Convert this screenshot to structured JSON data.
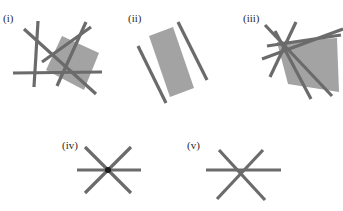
{
  "page": {
    "background_color": "#ffffff",
    "line_color": "#6b6b6b",
    "fill_color": "#a3a3a3",
    "dot_color": "#1a1a1a",
    "label_color": "#2b2b2b",
    "width": 343,
    "height": 211
  },
  "figures": [
    {
      "id": "fig-i",
      "label": "(i)",
      "label_x": 3,
      "label_y": 22,
      "description": "Four lines in general position bounding a shaded quadrilateral",
      "line_count": 4,
      "has_shaded_region": true,
      "shaded_region_sides": 4,
      "polygon": "62,36 99,53 84,90 46,70",
      "lines": [
        {
          "name": "line-1",
          "x1": 24,
          "y1": 29,
          "x2": 96,
          "y2": 94
        },
        {
          "name": "line-2",
          "x1": 38,
          "y1": 21,
          "x2": 34,
          "y2": 87
        },
        {
          "name": "line-3",
          "x1": 86,
          "y1": 22,
          "x2": 57,
          "y2": 86
        },
        {
          "name": "line-4",
          "x1": 13,
          "y1": 73,
          "x2": 102,
          "y2": 72
        },
        {
          "name": "line-5",
          "x1": 42,
          "y1": 62,
          "x2": 91,
          "y2": 27
        }
      ]
    },
    {
      "id": "fig-ii",
      "label": "(ii)",
      "label_x": 128,
      "label_y": 22,
      "description": "Two parallel lines bounding a shaded strip",
      "line_count": 2,
      "has_shaded_region": true,
      "shaded_region_sides": 4,
      "polygon": "149,36 173,27 194,88 170,97",
      "lines": [
        {
          "name": "line-1",
          "x1": 138,
          "y1": 46,
          "x2": 166,
          "y2": 103
        },
        {
          "name": "line-2",
          "x1": 178,
          "y1": 22,
          "x2": 207,
          "y2": 80
        }
      ]
    },
    {
      "id": "fig-iii",
      "label": "(iii)",
      "label_x": 243,
      "label_y": 22,
      "description": "Several lines bounding a shaded quadrilateral region",
      "line_count": 5,
      "has_shaded_region": true,
      "shaded_region_sides": 4,
      "polygon": "277,42 337,38 339,92 288,84",
      "lines": [
        {
          "name": "line-1",
          "x1": 265,
          "y1": 25,
          "x2": 332,
          "y2": 96
        },
        {
          "name": "line-2",
          "x1": 296,
          "y1": 22,
          "x2": 270,
          "y2": 77
        },
        {
          "name": "line-3",
          "x1": 267,
          "y1": 46,
          "x2": 341,
          "y2": 35
        },
        {
          "name": "line-4",
          "x1": 262,
          "y1": 59,
          "x2": 343,
          "y2": 29
        },
        {
          "name": "line-5",
          "x1": 275,
          "y1": 31,
          "x2": 311,
          "y2": 99
        }
      ]
    },
    {
      "id": "fig-iv",
      "label": "(iv)",
      "label_x": 62,
      "label_y": 149,
      "description": "Three concurrent lines meeting at a single point",
      "line_count": 3,
      "has_shaded_region": false,
      "concurrency_point": {
        "x": 108,
        "y": 170
      },
      "lines": [
        {
          "name": "line-1",
          "x1": 77,
          "y1": 170,
          "x2": 141,
          "y2": 170
        },
        {
          "name": "line-2",
          "x1": 85,
          "y1": 193,
          "x2": 131,
          "y2": 147
        },
        {
          "name": "line-3",
          "x1": 85,
          "y1": 147,
          "x2": 131,
          "y2": 193
        }
      ]
    },
    {
      "id": "fig-v",
      "label": "(v)",
      "label_x": 187,
      "label_y": 149,
      "description": "Three lines bounding a small triangle",
      "line_count": 3,
      "has_shaded_region": false,
      "lines": [
        {
          "name": "line-1",
          "x1": 206,
          "y1": 170,
          "x2": 281,
          "y2": 170
        },
        {
          "name": "line-2",
          "x1": 217,
          "y1": 199,
          "x2": 263,
          "y2": 150
        },
        {
          "name": "line-3",
          "x1": 219,
          "y1": 150,
          "x2": 265,
          "y2": 200
        }
      ]
    }
  ]
}
